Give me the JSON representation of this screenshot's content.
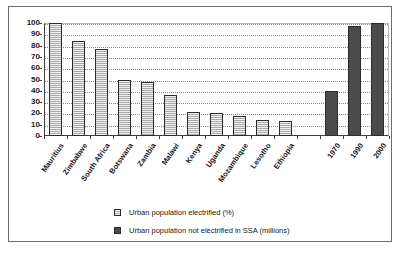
{
  "chart_data": {
    "type": "bar",
    "title": "",
    "subtitle": "",
    "xlabel": "",
    "ylabel": "",
    "ylim": [
      0,
      100
    ],
    "ytick_labels": [
      "0",
      "10",
      "20",
      "30",
      "40",
      "50",
      "60",
      "70",
      "80",
      "90",
      "100"
    ],
    "ytick_values": [
      0,
      10,
      20,
      30,
      40,
      50,
      60,
      70,
      80,
      90,
      100
    ],
    "grid": true,
    "grid_style": "dotted-horizontal",
    "legend_position": "bottom-center",
    "categories": [
      "Mauritius",
      "Zimbabwe",
      "South Africa",
      "Botswana",
      "Zambia",
      "Malawi",
      "Kenya",
      "Uganda",
      "Mozambique",
      "Lesotho",
      "Ethiopia",
      "",
      "1970",
      "1990",
      "2000"
    ],
    "series": [
      {
        "name": "Urban population electrified (%)",
        "color": "#a8a8a8",
        "pattern": "horizontal-hatch",
        "values": [
          100,
          84,
          77,
          50,
          48,
          36,
          21,
          20,
          17.5,
          14,
          13.5,
          null,
          null,
          null,
          null
        ]
      },
      {
        "name": "Urban population not electrified in SSA (millions)",
        "color": "#4a4a4a",
        "pattern": "solid",
        "values": [
          null,
          null,
          null,
          null,
          null,
          null,
          null,
          null,
          null,
          null,
          null,
          null,
          40,
          97,
          100
        ]
      }
    ],
    "bars": [
      {
        "label": "Mauritius",
        "value": 100,
        "series": "light"
      },
      {
        "label": "Zimbabwe",
        "value": 84,
        "series": "light"
      },
      {
        "label": "South Africa",
        "value": 77,
        "series": "light"
      },
      {
        "label": "Botswana",
        "value": 50,
        "series": "light"
      },
      {
        "label": "Zambia",
        "value": 48,
        "series": "light"
      },
      {
        "label": "Malawi",
        "value": 36,
        "series": "light"
      },
      {
        "label": "Kenya",
        "value": 21,
        "series": "light"
      },
      {
        "label": "Uganda",
        "value": 20,
        "series": "light"
      },
      {
        "label": "Mozambique",
        "value": 17.5,
        "series": "light"
      },
      {
        "label": "Lesotho",
        "value": 14,
        "series": "light"
      },
      {
        "label": "Ethiopia",
        "value": 13.5,
        "series": "light"
      },
      {
        "label": "",
        "value": 0,
        "series": "none"
      },
      {
        "label": "1970",
        "value": 40,
        "series": "dark"
      },
      {
        "label": "1990",
        "value": 97,
        "series": "dark"
      },
      {
        "label": "2000",
        "value": 100,
        "series": "dark"
      }
    ]
  },
  "legend": {
    "items": [
      {
        "label": "Urban population electrified (%)",
        "swatch": "light"
      },
      {
        "label": "Urban population not electrified in SSA (millions)",
        "swatch": "dark"
      }
    ]
  },
  "colors": {
    "light_bar": "#a8a8a8",
    "dark_bar": "#4a4a4a",
    "bar_border": "#2b2b2b",
    "axis": "#404040",
    "gridline": "#8a8a8a",
    "frame": "#6e6e6e",
    "text": "#161616",
    "background": "#ffffff"
  }
}
